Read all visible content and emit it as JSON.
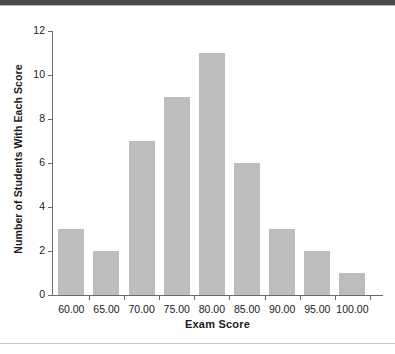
{
  "chart_data": {
    "type": "bar",
    "title": "",
    "subtitle": "",
    "xlabel": "Exam Score",
    "ylabel": "Number of Students With Each Score",
    "categories": [
      "60.00",
      "65.00",
      "70.00",
      "75.00",
      "80.00",
      "85.00",
      "90.00",
      "95.00",
      "100.00"
    ],
    "values": [
      3,
      2,
      7,
      9,
      11,
      6,
      3,
      2,
      1
    ],
    "ytick_labels": [
      "0",
      "2",
      "4",
      "6",
      "8",
      "10",
      "12"
    ],
    "ytick_values": [
      0,
      2,
      4,
      6,
      8,
      10,
      12
    ],
    "ylim": [
      0,
      12
    ],
    "grid": false,
    "legend": null,
    "bar_color": "#bdbdbd",
    "axis_color": "#6a6a6a",
    "text_color": "#1a1a1a"
  },
  "decor": {
    "top_band_color": "#4a4a4a",
    "bottom_rule_color": "#c9c9c9"
  }
}
